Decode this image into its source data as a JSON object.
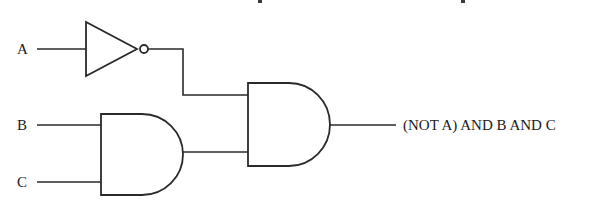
{
  "diagram": {
    "type": "logic-circuit",
    "inputs": [
      {
        "id": "A",
        "label": "A"
      },
      {
        "id": "B",
        "label": "B"
      },
      {
        "id": "C",
        "label": "C"
      }
    ],
    "gates": [
      {
        "id": "not1",
        "type": "NOT",
        "inputs": [
          "A"
        ]
      },
      {
        "id": "and1",
        "type": "AND",
        "inputs": [
          "B",
          "C"
        ]
      },
      {
        "id": "and2",
        "type": "AND",
        "inputs": [
          "not1",
          "and1"
        ]
      }
    ],
    "output": {
      "label": "(NOT A) AND B AND C",
      "from": "and2"
    },
    "colors": {
      "line": "#2a2a2a",
      "background": "#ffffff",
      "text": "#1a1a1a"
    }
  }
}
